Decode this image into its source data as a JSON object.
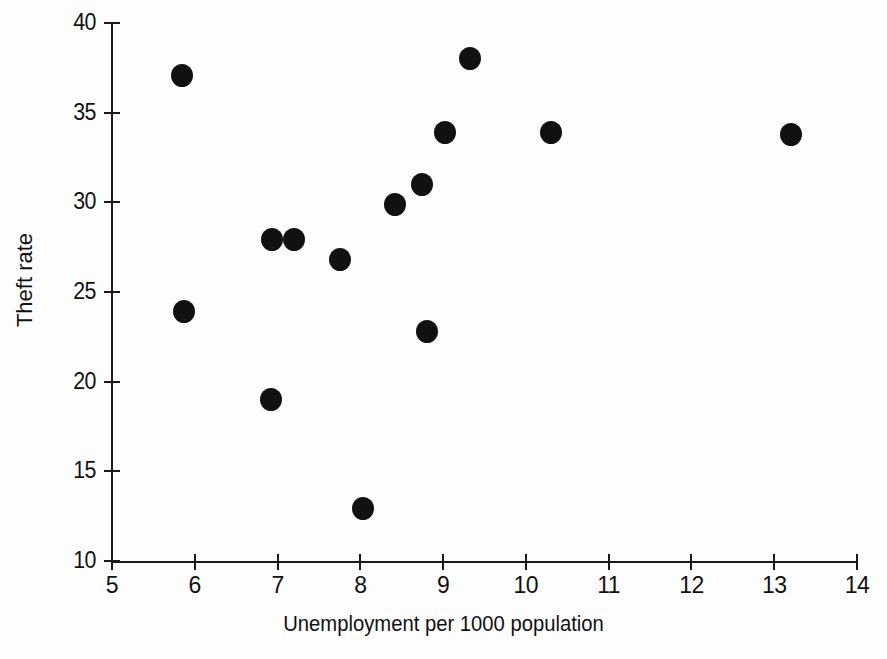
{
  "chart_data": {
    "type": "scatter",
    "title": "",
    "xlabel": "Unemployment per 1000 population",
    "ylabel": "Theft rate",
    "xlim": [
      5,
      14
    ],
    "ylim": [
      10,
      40
    ],
    "xticks": [
      5,
      6,
      7,
      8,
      9,
      10,
      11,
      12,
      13,
      14
    ],
    "xtick_labels": [
      "5",
      "6",
      "7",
      "8",
      "9",
      "10",
      "11",
      "12",
      "13",
      "14"
    ],
    "yticks": [
      10,
      15,
      20,
      25,
      30,
      35,
      40
    ],
    "ytick_labels": [
      "10",
      "15",
      "20",
      "25",
      "30",
      "35",
      "40"
    ],
    "grid": false,
    "legend": null,
    "marker": "filled-circle",
    "marker_color": "#111111",
    "axis_color": "#1a1a1a",
    "background_color": "#fdfdfd",
    "n_points": 14,
    "points": [
      {
        "x": 5.85,
        "y": 37.1
      },
      {
        "x": 5.87,
        "y": 23.9
      },
      {
        "x": 6.92,
        "y": 19.0
      },
      {
        "x": 6.93,
        "y": 27.9
      },
      {
        "x": 7.2,
        "y": 27.9
      },
      {
        "x": 7.75,
        "y": 26.8
      },
      {
        "x": 8.03,
        "y": 12.9
      },
      {
        "x": 8.42,
        "y": 29.9
      },
      {
        "x": 8.75,
        "y": 31.0
      },
      {
        "x": 8.8,
        "y": 22.8
      },
      {
        "x": 9.02,
        "y": 33.9
      },
      {
        "x": 9.32,
        "y": 38.0
      },
      {
        "x": 10.3,
        "y": 33.9
      },
      {
        "x": 13.2,
        "y": 33.8
      }
    ],
    "x": [
      5.85,
      5.87,
      6.92,
      6.93,
      7.2,
      7.75,
      8.03,
      8.42,
      8.75,
      8.8,
      9.02,
      9.32,
      10.3,
      13.2
    ],
    "values": [
      37.1,
      23.9,
      19.0,
      27.9,
      27.9,
      26.8,
      12.9,
      29.9,
      31.0,
      22.8,
      33.9,
      38.0,
      33.9,
      33.8
    ]
  },
  "layout": {
    "plot_left_px": 112,
    "plot_right_px": 857,
    "plot_top_px": 23,
    "plot_bottom_px": 561
  }
}
